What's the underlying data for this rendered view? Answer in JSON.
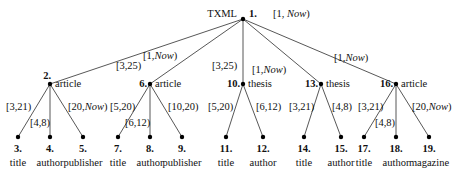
{
  "root": {
    "id": "1.",
    "label": "TXML",
    "x": 243,
    "y": 19,
    "edge_label_prefix": "[1, ",
    "edge_label_now": "Now",
    "edge_label_suffix": ")"
  },
  "now_word": "Now",
  "internal_nodes": [
    {
      "id": "2.",
      "label": "article",
      "x": 50,
      "y": 84,
      "edge": "[1,Now)",
      "edge_pre": "[1,",
      "edge_now": true
    },
    {
      "id": "6.",
      "label": "article",
      "x": 150,
      "y": 84,
      "edge": "[3,25)",
      "edge_pre": "[3,25)",
      "edge_now": false
    },
    {
      "id": "10.",
      "label": "thesis",
      "x": 243,
      "y": 84,
      "edge": "[3,25)",
      "edge_pre": "[3,25)",
      "edge_now": false
    },
    {
      "id": "13.",
      "label": "thesis",
      "x": 321,
      "y": 84,
      "edge": "[1,Now)",
      "edge_pre": "[1,",
      "edge_now": true
    },
    {
      "id": "16.",
      "label": "article",
      "x": 396,
      "y": 84,
      "edge": "[1,Now)",
      "edge_pre": "[1,",
      "edge_now": true
    }
  ],
  "leaves": [
    {
      "id": "3.",
      "label": "title",
      "x": 18,
      "parent": 0,
      "edge": "[3,21)"
    },
    {
      "id": "4.",
      "label": "author",
      "x": 50,
      "parent": 0,
      "edge": "[4,8)"
    },
    {
      "id": "5.",
      "label": "publisher",
      "x": 83,
      "parent": 0,
      "edge": "[20,Now)"
    },
    {
      "id": "7.",
      "label": "title",
      "x": 118,
      "parent": 1,
      "edge": "[5,20)"
    },
    {
      "id": "8.",
      "label": "author",
      "x": 150,
      "parent": 1,
      "edge": "[6,12)"
    },
    {
      "id": "9.",
      "label": "publisher",
      "x": 182,
      "parent": 1,
      "edge": "[10,20)"
    },
    {
      "id": "11.",
      "label": "title",
      "x": 226,
      "parent": 2,
      "edge": "[5,20)"
    },
    {
      "id": "12.",
      "label": "author",
      "x": 263,
      "parent": 2,
      "edge": "[6,12)"
    },
    {
      "id": "14.",
      "label": "title",
      "x": 304,
      "parent": 3,
      "edge": "[3,21)"
    },
    {
      "id": "15.",
      "label": "author",
      "x": 341,
      "parent": 3,
      "edge": "[4,8)"
    },
    {
      "id": "17.",
      "label": "title",
      "x": 364,
      "parent": 4,
      "edge": "[3,21)"
    },
    {
      "id": "18.",
      "label": "author",
      "x": 396,
      "parent": 4,
      "edge": "[4,8)"
    },
    {
      "id": "19.",
      "label": "magazine",
      "x": 429,
      "parent": 4,
      "edge": "[20,Now)"
    }
  ],
  "labels": {
    "root_title": "TXML",
    "root_id": "1.",
    "root_edge": "[1, Now)",
    "e_1_2": "[1,Now)",
    "e_1_6": "[3,25)",
    "e_1_10": "[3,25)",
    "e_1_13": "[1,Now)",
    "e_1_16": "[1,Now)",
    "e_2_3": "[3,21)",
    "e_2_4": "[4,8)",
    "e_2_5": "[20,Now)",
    "e_6_7": "[5,20)",
    "e_6_8": "[6,12)",
    "e_6_9": "[10,20)",
    "e_10_11": "[5,20)",
    "e_10_12": "[6,12)",
    "e_13_14": "[3,21)",
    "e_13_15": "[4,8)",
    "e_16_17": "[3,21)",
    "e_16_18": "[4,8)",
    "e_16_19": "[20,Now)"
  }
}
